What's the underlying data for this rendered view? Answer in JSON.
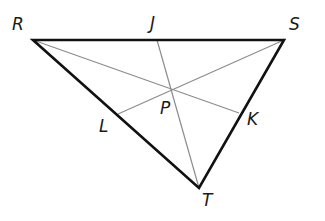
{
  "diagram": {
    "type": "triangle-with-medians",
    "colors": {
      "side": "#111111",
      "median": "#8c8c8c",
      "label": "#1a1a1a"
    },
    "vertices": {
      "R": {
        "label": "R",
        "x": 33,
        "y": 40,
        "lx": 12,
        "ly": 30
      },
      "S": {
        "label": "S",
        "x": 284,
        "y": 40,
        "lx": 289,
        "ly": 30
      },
      "T": {
        "label": "T",
        "x": 199,
        "y": 188,
        "lx": 202,
        "ly": 206
      }
    },
    "midpoints": {
      "J": {
        "label": "J",
        "x": 157,
        "y": 40,
        "lx": 150,
        "ly": 29
      },
      "L": {
        "label": "L",
        "x": 118,
        "y": 114,
        "lx": 99,
        "ly": 132
      },
      "K": {
        "label": "K",
        "x": 239,
        "y": 113,
        "lx": 247,
        "ly": 125
      }
    },
    "centroid": {
      "label": "P",
      "x": 170,
      "y": 89,
      "lx": 160,
      "ly": 114
    },
    "sides": [
      [
        "R",
        "S"
      ],
      [
        "S",
        "T"
      ],
      [
        "T",
        "R"
      ]
    ],
    "medians": [
      [
        "R",
        "K"
      ],
      [
        "S",
        "L"
      ],
      [
        "J",
        "T"
      ]
    ]
  }
}
